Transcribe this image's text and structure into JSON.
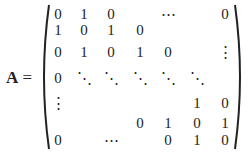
{
  "formula": {
    "lhs_symbol": "A",
    "equals": "=",
    "matrix": {
      "type": "tridiagonal",
      "rows": [
        [
          "0",
          "1",
          "0",
          "",
          "⋯",
          "",
          "0"
        ],
        [
          "1",
          "0",
          "1",
          "0",
          "",
          "",
          ""
        ],
        [
          "0",
          "1",
          "0",
          "1",
          "0",
          "",
          "⋮"
        ],
        [
          "0",
          "⋱",
          "⋱",
          "⋱",
          "⋱",
          "⋱",
          ""
        ],
        [
          "⋮",
          "",
          "",
          "",
          "",
          "1",
          "0"
        ],
        [
          "",
          "",
          "",
          "0",
          "1",
          "0",
          "1"
        ],
        [
          "0",
          "",
          "⋯",
          "",
          "0",
          "1",
          "0"
        ]
      ]
    }
  }
}
